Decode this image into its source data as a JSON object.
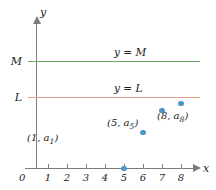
{
  "figure": {
    "axes": {
      "x_axis_name": "x",
      "y_axis_name": "y",
      "origin_label": "0"
    },
    "reference_lines": [
      {
        "value_label": "M",
        "caption": "y = M",
        "color": "#6fa76c"
      },
      {
        "value_label": "L",
        "caption": "y = L",
        "color": "#e8a188"
      }
    ]
  },
  "chart_data": {
    "type": "scatter",
    "title": "",
    "xlabel": "x",
    "ylabel": "y",
    "xlim": [
      0,
      8.6
    ],
    "ylim": [
      0,
      1.22
    ],
    "grid": false,
    "legend": "none",
    "point_color": "#4d96c8",
    "x": [
      1,
      2,
      3,
      4,
      5,
      6,
      7,
      8
    ],
    "values": [
      0.39,
      0.52,
      0.65,
      0.76,
      0.85,
      0.9,
      0.93,
      0.94
    ],
    "tick_labels_x": [
      "1",
      "2",
      "3",
      "4",
      "5",
      "6",
      "7",
      "8"
    ],
    "tick_labels_y": [
      "L",
      "M"
    ],
    "annotations": [
      {
        "point_index": 0,
        "text": "(1, a",
        "subscript": "1",
        "text_end": ")"
      },
      {
        "point_index": 4,
        "text": "(5, a",
        "subscript": "5",
        "text_end": ")"
      },
      {
        "point_index": 7,
        "text": "(8, a",
        "subscript": "8",
        "text_end": ")"
      }
    ],
    "hlines": [
      {
        "label": "M",
        "y": 1.0,
        "caption": "y = M",
        "color": "#6fa76c"
      },
      {
        "label": "L",
        "y": 0.95,
        "caption": "y = L",
        "color": "#e8a188"
      }
    ]
  }
}
